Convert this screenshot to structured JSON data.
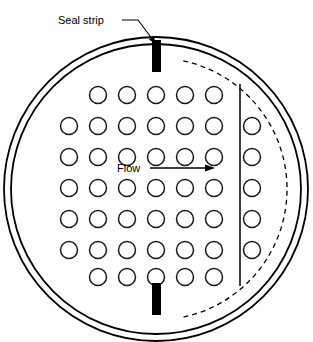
{
  "figure": {
    "type": "engineering-cross-section",
    "background_color": "#ffffff",
    "line_color": "#000000",
    "seal_strip_color": "#000000",
    "tube_fill_color": "#ffffff"
  },
  "labels": {
    "seal_strip": "Seal strip",
    "flow": "Flow"
  },
  "shell": {
    "outer_circle": {
      "cx": 156,
      "cy": 189,
      "r": 152
    },
    "inner_circle": {
      "cx": 156,
      "cy": 189,
      "r": 145
    },
    "ring_count": 2
  },
  "outer_tube_limit": {
    "style": "dashed",
    "cx": 156,
    "cy": 189,
    "r": 131
  },
  "baffle": {
    "orientation": "vertical",
    "x": 240,
    "y_top": 84,
    "y_bottom": 286
  },
  "seal_strips": [
    {
      "name": "top-seal-strip",
      "x": 152,
      "y": 40,
      "width": 9,
      "height": 32
    },
    {
      "name": "bottom-seal-strip",
      "x": 152,
      "y": 283,
      "width": 9,
      "height": 32
    }
  ],
  "flow_arrow": {
    "x_start": 150,
    "x_end": 215,
    "y": 168,
    "direction": "right"
  },
  "seal_strip_leader": {
    "from_x": 122,
    "from_y": 20,
    "bend_x": 138,
    "bend_y": 20,
    "to_x": 156,
    "to_y": 44
  },
  "tube_layout": {
    "pattern": "inline-square",
    "row_count": 7,
    "tube_radius": 8.5,
    "column_pitch": 29,
    "row_pitch": 31,
    "rows": [
      {
        "index": 1,
        "y": 95,
        "x_positions": [
          98,
          127,
          156,
          185,
          214
        ]
      },
      {
        "index": 2,
        "y": 126,
        "x_positions": [
          69,
          98,
          127,
          156,
          185,
          214,
          252
        ]
      },
      {
        "index": 3,
        "y": 157,
        "x_positions": [
          69,
          98,
          127,
          156,
          185,
          214,
          252
        ]
      },
      {
        "index": 4,
        "y": 188,
        "x_positions": [
          69,
          98,
          127,
          156,
          185,
          214,
          252
        ]
      },
      {
        "index": 5,
        "y": 219,
        "x_positions": [
          69,
          98,
          127,
          156,
          185,
          214,
          252
        ]
      },
      {
        "index": 6,
        "y": 250,
        "x_positions": [
          69,
          98,
          127,
          156,
          185,
          214,
          252
        ]
      },
      {
        "index": 7,
        "y": 277,
        "x_positions": [
          98,
          127,
          156,
          185,
          214
        ]
      }
    ],
    "total_tubes": 52
  }
}
